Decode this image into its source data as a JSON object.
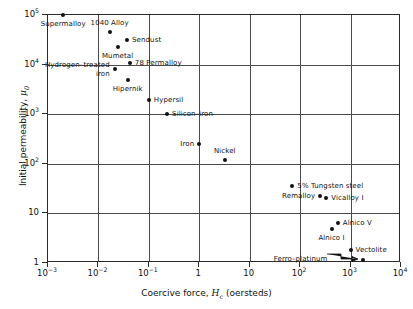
{
  "chart_data": {
    "type": "scatter",
    "title": "",
    "xlabel": "Coercive force, Hc (oersteds)",
    "ylabel": "Initial permeability, μ0",
    "xscale": "log",
    "yscale": "log",
    "xlim": [
      0.001,
      10000
    ],
    "ylim": [
      1,
      100000
    ],
    "grid": true,
    "legend": "none",
    "xticks": [
      {
        "value": 0.001,
        "label": "10",
        "exp": "−3"
      },
      {
        "value": 0.01,
        "label": "10",
        "exp": "−2"
      },
      {
        "value": 0.1,
        "label": "10",
        "exp": "−1"
      },
      {
        "value": 1,
        "label": "1",
        "exp": ""
      },
      {
        "value": 10,
        "label": "10",
        "exp": ""
      },
      {
        "value": 100,
        "label": "10",
        "exp": "2"
      },
      {
        "value": 1000,
        "label": "10",
        "exp": "3"
      },
      {
        "value": 10000,
        "label": "10",
        "exp": "4"
      }
    ],
    "yticks": [
      {
        "value": 100000,
        "label": "10",
        "exp": "5"
      },
      {
        "value": 10000,
        "label": "10",
        "exp": "4"
      },
      {
        "value": 1000,
        "label": "10",
        "exp": "3"
      },
      {
        "value": 100,
        "label": "10",
        "exp": "2"
      },
      {
        "value": 10,
        "label": "10",
        "exp": ""
      },
      {
        "value": 1,
        "label": "1",
        "exp": ""
      }
    ],
    "points": [
      {
        "name": "Supermalloy",
        "x": 0.002,
        "y": 100000,
        "label": "Supermalloy",
        "pos": "below-left"
      },
      {
        "name": "1040 Alloy",
        "x": 0.0167,
        "y": 45000,
        "label": "1040 Alloy",
        "pos": "above"
      },
      {
        "name": "Sendust",
        "x": 0.037,
        "y": 32000,
        "label": "Sendust",
        "pos": "right"
      },
      {
        "name": "Mumetal",
        "x": 0.024,
        "y": 23000,
        "label": "Mumetal",
        "pos": "below"
      },
      {
        "name": "78 Permalloy",
        "x": 0.042,
        "y": 11000,
        "label": "78 Permalloy",
        "pos": "right"
      },
      {
        "name": "Hydrogen-treated iron",
        "x": 0.021,
        "y": 8000,
        "label": "Hydrogen–treated\niron",
        "pos": "left"
      },
      {
        "name": "Hipernik",
        "x": 0.038,
        "y": 5000,
        "label": "Hipernik",
        "pos": "below"
      },
      {
        "name": "Hypersil",
        "x": 0.1,
        "y": 1900,
        "label": "Hypersil",
        "pos": "right"
      },
      {
        "name": "Silicon-iron",
        "x": 0.23,
        "y": 1000,
        "label": "Silicon–iron",
        "pos": "right"
      },
      {
        "name": "Iron",
        "x": 1.0,
        "y": 250,
        "label": "Iron",
        "pos": "left"
      },
      {
        "name": "Nickel",
        "x": 3.2,
        "y": 120,
        "label": "Nickel",
        "pos": "above"
      },
      {
        "name": "5% Tungsten steel",
        "x": 70,
        "y": 35,
        "label": "5% Tungsten steel",
        "pos": "right"
      },
      {
        "name": "Remalloy",
        "x": 250,
        "y": 22,
        "label": "Remalloy",
        "pos": "left"
      },
      {
        "name": "Vicalloy I",
        "x": 330,
        "y": 20,
        "label": "Vicalloy I",
        "pos": "right"
      },
      {
        "name": "Alnico V",
        "x": 560,
        "y": 6.5,
        "label": "Alnico V",
        "pos": "right"
      },
      {
        "name": "Alnico I",
        "x": 420,
        "y": 4.8,
        "label": "Alnico I",
        "pos": "below"
      },
      {
        "name": "Vectolite",
        "x": 1000,
        "y": 1.8,
        "label": "Vectolite",
        "pos": "right"
      },
      {
        "name": "Ferro-platinum",
        "x": 1800,
        "y": 1.15,
        "label": "Ferro–platinum",
        "pos": "leader-left"
      }
    ]
  },
  "axis": {
    "x_title_prefix": "Coercive force, ",
    "x_title_symbol": "H",
    "x_title_sub": "c",
    "x_title_suffix": " (oersteds)",
    "y_title_prefix": "Initial permeability, ",
    "y_title_symbol": "μ",
    "y_title_sub": "0"
  }
}
